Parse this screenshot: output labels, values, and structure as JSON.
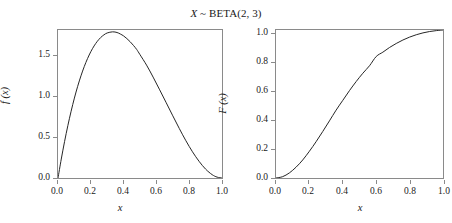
{
  "figure": {
    "title_prefix": "X",
    "title_rest": " ~ BETA(2, 3)",
    "title_full": "X ~ BETA(2, 3)",
    "background_color": "#ffffff",
    "line_color": "#262626",
    "frame_color": "#8a8a8a"
  },
  "chart_data": [
    {
      "type": "line",
      "panel": "left",
      "title": "X ~ BETA(2, 3)",
      "subtitle": "probability density function",
      "xlabel": "x",
      "ylabel": "f (x)",
      "xlim": [
        0.0,
        1.0
      ],
      "ylim": [
        0.0,
        1.8
      ],
      "grid": false,
      "legend": "none",
      "xticks": [
        "0.0",
        "0.2",
        "0.4",
        "0.6",
        "0.8",
        "1.0"
      ],
      "xtick_values": [
        0.0,
        0.2,
        0.4,
        0.6,
        0.8,
        1.0
      ],
      "yticks": [
        "0.0",
        "0.5",
        "1.0",
        "1.5"
      ],
      "ytick_values": [
        0.0,
        0.5,
        1.0,
        1.5
      ],
      "series": [
        {
          "name": "f(x) = 12 x (1-x)^2",
          "x": [
            0.0,
            0.02,
            0.04,
            0.06,
            0.08,
            0.1,
            0.12,
            0.14,
            0.16,
            0.18,
            0.2,
            0.22,
            0.24,
            0.26,
            0.28,
            0.3,
            0.3333,
            0.36,
            0.38,
            0.4,
            0.42,
            0.44,
            0.46,
            0.48,
            0.5,
            0.54,
            0.58,
            0.62,
            0.66,
            0.7,
            0.74,
            0.78,
            0.82,
            0.86,
            0.9,
            0.94,
            0.97,
            1.0
          ],
          "y": [
            0.0,
            0.2305,
            0.4424,
            0.6362,
            0.8122,
            0.972,
            1.1151,
            1.2424,
            1.3547,
            1.4524,
            1.536,
            1.6061,
            1.6632,
            1.7079,
            1.7409,
            1.764,
            1.7778,
            1.7694,
            1.7514,
            1.728,
            1.6954,
            1.6572,
            1.6126,
            1.5628,
            1.5,
            1.373,
            1.2272,
            1.0723,
            0.9147,
            0.756,
            0.6004,
            0.453,
            0.3189,
            0.2032,
            0.108,
            0.0406,
            0.0108,
            0.0
          ]
        }
      ]
    },
    {
      "type": "line",
      "panel": "right",
      "title": "X ~ BETA(2, 3)",
      "subtitle": "cumulative distribution function",
      "xlabel": "x",
      "ylabel": "F (x)",
      "xlim": [
        0.0,
        1.0
      ],
      "ylim": [
        0.0,
        1.0
      ],
      "grid": false,
      "legend": "none",
      "xticks": [
        "0.0",
        "0.2",
        "0.4",
        "0.6",
        "0.8",
        "1.0"
      ],
      "xtick_values": [
        0.0,
        0.2,
        0.4,
        0.6,
        0.8,
        1.0
      ],
      "yticks": [
        "0.0",
        "0.2",
        "0.4",
        "0.6",
        "0.8",
        "1.0"
      ],
      "ytick_values": [
        0.0,
        0.2,
        0.4,
        0.6,
        0.8,
        1.0
      ],
      "series": [
        {
          "name": "F(x) = 1 - (1-x)^3 (1+3x)",
          "x": [
            0.0,
            0.04,
            0.08,
            0.12,
            0.16,
            0.2,
            0.24,
            0.28,
            0.32,
            0.36,
            0.4,
            0.44,
            0.48,
            0.52,
            0.56,
            0.6,
            0.64,
            0.68,
            0.72,
            0.76,
            0.8,
            0.84,
            0.88,
            0.92,
            0.96,
            1.0
          ],
          "y": [
            0.0,
            0.0091,
            0.0344,
            0.073,
            0.1219,
            0.1808,
            0.2452,
            0.3144,
            0.3861,
            0.4585,
            0.5248,
            0.5904,
            0.6517,
            0.7078,
            0.7585,
            0.8208,
            0.8503,
            0.882,
            0.9089,
            0.9324,
            0.952,
            0.968,
            0.9805,
            0.9897,
            0.9959,
            1.0
          ]
        }
      ]
    }
  ],
  "panels": {
    "pdf": {
      "name": "pdf-panel",
      "ylabel": "f (x)",
      "ylabel_letter": "f",
      "ylabel_arg": "(x)",
      "xlabel": "x",
      "yticklabels": [
        "1.5",
        "1.0",
        "0.5",
        "0.0"
      ],
      "xticklabels": [
        "0.0",
        "0.2",
        "0.4",
        "0.6",
        "0.8",
        "1.0"
      ]
    },
    "cdf": {
      "name": "cdf-panel",
      "ylabel": "F (x)",
      "ylabel_letter": "F",
      "ylabel_arg": "(x)",
      "xlabel": "x",
      "yticklabels": [
        "1.0",
        "0.8",
        "0.6",
        "0.4",
        "0.2",
        "0.0"
      ],
      "xticklabels": [
        "0.0",
        "0.2",
        "0.4",
        "0.6",
        "0.8",
        "1.0"
      ]
    }
  }
}
